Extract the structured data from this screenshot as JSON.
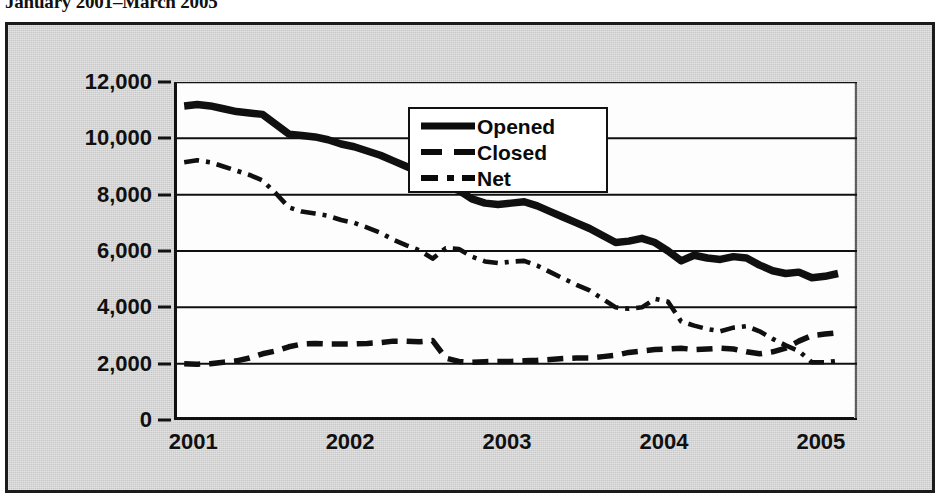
{
  "title": "January 2001–March 2005",
  "legend": {
    "position": "inside-top-center",
    "items": [
      {
        "label": "Opened",
        "style": "solid",
        "icon": "solid-line-swatch"
      },
      {
        "label": "Closed",
        "style": "dashed",
        "icon": "dashed-line-swatch"
      },
      {
        "label": "Net",
        "style": "dash-dot",
        "icon": "dash-dot-line-swatch"
      }
    ]
  },
  "axes": {
    "y_ticks": [
      "12,000",
      "10,000",
      "8,000",
      "6,000",
      "4,000",
      "2,000",
      "0"
    ],
    "x_ticks": [
      "2001",
      "2002",
      "2003",
      "2004",
      "2005"
    ]
  },
  "colors": {
    "line": "#101010",
    "plot_background": "#fdfdfd",
    "frame_background": "#c9c9c9",
    "frame_border": "#1b1b1b",
    "text": "#101010"
  },
  "chart_data": {
    "type": "line",
    "title": "January 2001–March 2005",
    "xlabel": "",
    "ylabel": "",
    "ylim": [
      0,
      12000
    ],
    "ytick_values": [
      0,
      2000,
      4000,
      6000,
      8000,
      10000,
      12000
    ],
    "grid": true,
    "legend_position": "inside-top-center",
    "x_axis_type": "monthly",
    "x_tick_labels": [
      "2001",
      "2002",
      "2003",
      "2004",
      "2005"
    ],
    "x_tick_positions": [
      0,
      12,
      24,
      36,
      48
    ],
    "x": [
      "2001-01",
      "2001-02",
      "2001-03",
      "2001-04",
      "2001-05",
      "2001-06",
      "2001-07",
      "2001-08",
      "2001-09",
      "2001-10",
      "2001-11",
      "2001-12",
      "2002-01",
      "2002-02",
      "2002-03",
      "2002-04",
      "2002-05",
      "2002-06",
      "2002-07",
      "2002-08",
      "2002-09",
      "2002-10",
      "2002-11",
      "2002-12",
      "2003-01",
      "2003-02",
      "2003-03",
      "2003-04",
      "2003-05",
      "2003-06",
      "2003-07",
      "2003-08",
      "2003-09",
      "2003-10",
      "2003-11",
      "2003-12",
      "2004-01",
      "2004-02",
      "2004-03",
      "2004-04",
      "2004-05",
      "2004-06",
      "2004-07",
      "2004-08",
      "2004-09",
      "2004-10",
      "2004-11",
      "2004-12",
      "2005-01",
      "2005-02",
      "2005-03"
    ],
    "series": [
      {
        "name": "Opened",
        "style": "solid",
        "values": [
          11150,
          11200,
          11150,
          11050,
          10950,
          10900,
          10850,
          10500,
          10150,
          10100,
          10050,
          9950,
          9800,
          9700,
          9550,
          9400,
          9200,
          9000,
          8800,
          8550,
          8300,
          8150,
          7850,
          7700,
          7650,
          7700,
          7750,
          7600,
          7400,
          7200,
          7000,
          6800,
          6550,
          6300,
          6350,
          6450,
          6300,
          6000,
          5650,
          5850,
          5750,
          5700,
          5800,
          5750,
          5500,
          5300,
          5200,
          5250,
          5050,
          5100,
          5200
        ]
      },
      {
        "name": "Closed",
        "style": "dashed",
        "values": [
          2000,
          1980,
          2000,
          2050,
          2100,
          2200,
          2350,
          2450,
          2600,
          2700,
          2720,
          2700,
          2700,
          2700,
          2720,
          2750,
          2800,
          2800,
          2780,
          2820,
          2200,
          2080,
          2050,
          2070,
          2080,
          2080,
          2100,
          2120,
          2150,
          2180,
          2200,
          2200,
          2250,
          2300,
          2400,
          2450,
          2500,
          2520,
          2550,
          2500,
          2520,
          2550,
          2520,
          2420,
          2350,
          2420,
          2550,
          2800,
          3000,
          3050,
          3100
        ]
      },
      {
        "name": "Net",
        "style": "dash-dot",
        "values": [
          9150,
          9220,
          9150,
          9000,
          8850,
          8700,
          8500,
          8050,
          7550,
          7400,
          7330,
          7250,
          7100,
          7000,
          6830,
          6650,
          6400,
          6200,
          6020,
          5730,
          6100,
          6070,
          5800,
          5630,
          5570,
          5620,
          5650,
          5480,
          5250,
          5020,
          4800,
          4600,
          4300,
          4000,
          3950,
          4000,
          4300,
          4200,
          3500,
          3350,
          3230,
          3150,
          3280,
          3330,
          3150,
          2880,
          2650,
          2450,
          2050,
          2050,
          2100
        ]
      }
    ]
  }
}
